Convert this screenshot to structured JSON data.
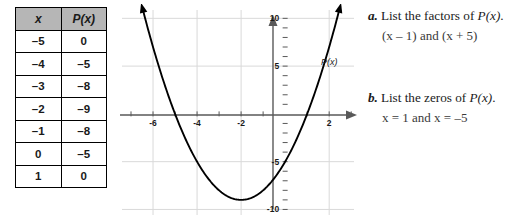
{
  "table": {
    "headers": [
      "x",
      "P(x)"
    ],
    "rows": [
      [
        "–5",
        "0"
      ],
      [
        "–4",
        "–5"
      ],
      [
        "–3",
        "–8"
      ],
      [
        "–2",
        "–9"
      ],
      [
        "–1",
        "–8"
      ],
      [
        "0",
        "–5"
      ],
      [
        "1",
        "0"
      ]
    ]
  },
  "chart_data": {
    "type": "line",
    "title": "",
    "xlabel": "",
    "ylabel": "",
    "curve_label": "P(x)",
    "xlim": [
      -7.5,
      3.4
    ],
    "ylim": [
      -11,
      11.5
    ],
    "xticks": [
      -6,
      -4,
      -2,
      2
    ],
    "xtick_labels": [
      "-6",
      "-4",
      "-2",
      "2"
    ],
    "yticks": [
      10,
      5,
      -5,
      -10
    ],
    "ytick_labels": [
      "10",
      "5",
      "-5",
      "-10"
    ],
    "grid": true,
    "grid_color": "#d9d9d9",
    "axis_color": "#595959",
    "curve_color": "#000000",
    "legend": "none",
    "x": [
      -5,
      -4,
      -3,
      -2,
      -1,
      0,
      1
    ],
    "y": [
      0,
      -5,
      -8,
      -9,
      -8,
      -5,
      0
    ],
    "equation": "y = (x - 1)(x + 5)",
    "vertex": [
      -2,
      -9
    ],
    "roots": [
      -5,
      1
    ],
    "y_intercept": -5,
    "arrows": [
      "left-up",
      "right-up"
    ]
  },
  "questions": [
    {
      "letter": "a.",
      "prompt_pre": "List the factors of ",
      "prompt_math": "P(x)",
      "prompt_post": ".",
      "answer": "(x – 1) and (x + 5)"
    },
    {
      "letter": "b.",
      "prompt_pre": "List the zeros of ",
      "prompt_math": "P(x)",
      "prompt_post": ".",
      "answer": "x = 1 and x = –5"
    }
  ]
}
